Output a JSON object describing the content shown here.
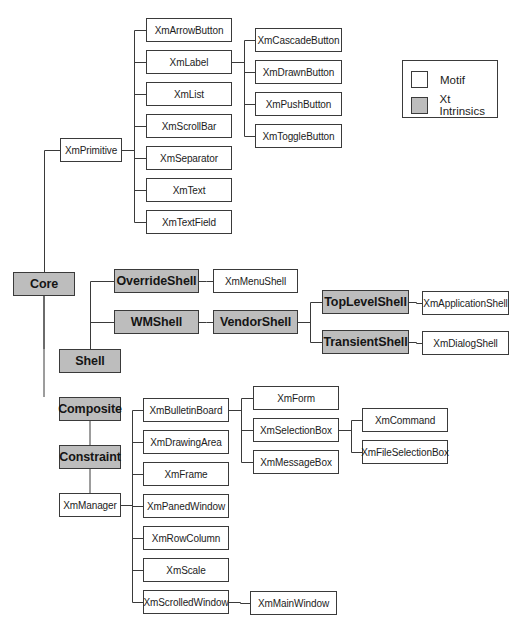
{
  "diagram": {
    "type": "class-hierarchy-tree",
    "colors": {
      "motif": "#ffffff",
      "xt": "#bdbdbd",
      "line": "#3a3a3a"
    },
    "legend": {
      "box": [
        402,
        60,
        96,
        58
      ],
      "items": [
        {
          "label": "Motif",
          "kind": "motif"
        },
        {
          "label": "Xt Intrinsics",
          "kind": "xt"
        }
      ]
    },
    "nodes": [
      {
        "id": "core",
        "label": "Core",
        "kind": "xt",
        "box": [
          13,
          272,
          62,
          24
        ]
      },
      {
        "id": "xmprimitive",
        "label": "XmPrimitive",
        "kind": "motif",
        "box": [
          60,
          138,
          62,
          24
        ]
      },
      {
        "id": "xmarrowbutton",
        "label": "XmArrowButton",
        "kind": "motif",
        "box": [
          146,
          18,
          86,
          24
        ]
      },
      {
        "id": "xmlabel",
        "label": "XmLabel",
        "kind": "motif",
        "box": [
          146,
          50,
          86,
          24
        ]
      },
      {
        "id": "xmlist",
        "label": "XmList",
        "kind": "motif",
        "box": [
          146,
          82,
          86,
          24
        ]
      },
      {
        "id": "xmscrollbar",
        "label": "XmScrollBar",
        "kind": "motif",
        "box": [
          146,
          114,
          86,
          24
        ]
      },
      {
        "id": "xmseparator",
        "label": "XmSeparator",
        "kind": "motif",
        "box": [
          146,
          146,
          86,
          24
        ]
      },
      {
        "id": "xmtext",
        "label": "XmText",
        "kind": "motif",
        "box": [
          146,
          178,
          86,
          24
        ]
      },
      {
        "id": "xmtextfield",
        "label": "XmTextField",
        "kind": "motif",
        "box": [
          146,
          210,
          86,
          24
        ]
      },
      {
        "id": "xmcascadebutton",
        "label": "XmCascadeButton",
        "kind": "motif",
        "box": [
          255,
          28,
          87,
          24
        ]
      },
      {
        "id": "xmdrawnbutton",
        "label": "XmDrawnButton",
        "kind": "motif",
        "box": [
          255,
          60,
          87,
          24
        ]
      },
      {
        "id": "xmpushbutton",
        "label": "XmPushButton",
        "kind": "motif",
        "box": [
          255,
          92,
          87,
          24
        ]
      },
      {
        "id": "xmtogglebutton",
        "label": "XmToggleButton",
        "kind": "motif",
        "box": [
          255,
          124,
          87,
          24
        ]
      },
      {
        "id": "overrideshell",
        "label": "OverrideShell",
        "kind": "xt",
        "box": [
          114,
          269,
          85,
          24
        ]
      },
      {
        "id": "xmmenushell",
        "label": "XmMenuShell",
        "kind": "motif",
        "box": [
          213,
          269,
          85,
          24
        ]
      },
      {
        "id": "wmshell",
        "label": "WMShell",
        "kind": "xt",
        "box": [
          114,
          310,
          85,
          24
        ]
      },
      {
        "id": "vendorshell",
        "label": "VendorShell",
        "kind": "xt",
        "box": [
          213,
          310,
          85,
          24
        ]
      },
      {
        "id": "toplevelshell",
        "label": "TopLevelShell",
        "kind": "xt",
        "box": [
          322,
          290,
          87,
          24
        ]
      },
      {
        "id": "xmapplicationshell",
        "label": "XmApplicationShell",
        "kind": "motif",
        "box": [
          422,
          291,
          87,
          24
        ]
      },
      {
        "id": "transientshell",
        "label": "TransientShell",
        "kind": "xt",
        "box": [
          322,
          330,
          87,
          24
        ]
      },
      {
        "id": "xmdialogshell",
        "label": "XmDialogShell",
        "kind": "motif",
        "box": [
          422,
          331,
          87,
          24
        ]
      },
      {
        "id": "shell",
        "label": "Shell",
        "kind": "xt",
        "box": [
          59,
          349,
          62,
          24
        ]
      },
      {
        "id": "composite",
        "label": "Composite",
        "kind": "xt",
        "box": [
          59,
          397,
          62,
          24
        ]
      },
      {
        "id": "constraint",
        "label": "Constraint",
        "kind": "xt",
        "box": [
          59,
          445,
          62,
          24
        ]
      },
      {
        "id": "xmmanager",
        "label": "XmManager",
        "kind": "motif",
        "box": [
          59,
          493,
          62,
          24
        ]
      },
      {
        "id": "xmbulletinboard",
        "label": "XmBulletinBoard",
        "kind": "motif",
        "box": [
          143,
          398,
          86,
          24
        ]
      },
      {
        "id": "xmdrawingarea",
        "label": "XmDrawingArea",
        "kind": "motif",
        "box": [
          143,
          430,
          86,
          24
        ]
      },
      {
        "id": "xmframe",
        "label": "XmFrame",
        "kind": "motif",
        "box": [
          143,
          462,
          86,
          24
        ]
      },
      {
        "id": "xmpanedwindow",
        "label": "XmPanedWindow",
        "kind": "motif",
        "box": [
          143,
          494,
          86,
          24
        ]
      },
      {
        "id": "xmrowcolumn",
        "label": "XmRowColumn",
        "kind": "motif",
        "box": [
          143,
          526,
          86,
          24
        ]
      },
      {
        "id": "xmscale",
        "label": "XmScale",
        "kind": "motif",
        "box": [
          143,
          558,
          86,
          24
        ]
      },
      {
        "id": "xmscrolledwindow",
        "label": "XmScrolledWindow",
        "kind": "motif",
        "box": [
          143,
          590,
          86,
          24
        ]
      },
      {
        "id": "xmform",
        "label": "XmForm",
        "kind": "motif",
        "box": [
          253,
          386,
          86,
          24
        ]
      },
      {
        "id": "xmselectionbox",
        "label": "XmSelectionBox",
        "kind": "motif",
        "box": [
          253,
          418,
          86,
          24
        ]
      },
      {
        "id": "xmmessagebox",
        "label": "XmMessageBox",
        "kind": "motif",
        "box": [
          253,
          450,
          86,
          24
        ]
      },
      {
        "id": "xmcommand",
        "label": "XmCommand",
        "kind": "motif",
        "box": [
          362,
          408,
          86,
          24
        ]
      },
      {
        "id": "xmfileselectionbox",
        "label": "XmFileSelectionBox",
        "kind": "motif",
        "box": [
          362,
          440,
          86,
          24
        ]
      },
      {
        "id": "xmmainwindow",
        "label": "XmMainWindow",
        "kind": "motif",
        "box": [
          250,
          591,
          87,
          24
        ]
      }
    ],
    "edges": [
      [
        "core",
        "xmprimitive"
      ],
      [
        "core",
        "shell"
      ],
      [
        "core",
        "composite"
      ],
      [
        "xmprimitive",
        "xmarrowbutton"
      ],
      [
        "xmprimitive",
        "xmlabel"
      ],
      [
        "xmprimitive",
        "xmlist"
      ],
      [
        "xmprimitive",
        "xmscrollbar"
      ],
      [
        "xmprimitive",
        "xmseparator"
      ],
      [
        "xmprimitive",
        "xmtext"
      ],
      [
        "xmprimitive",
        "xmtextfield"
      ],
      [
        "xmlabel",
        "xmcascadebutton"
      ],
      [
        "xmlabel",
        "xmdrawnbutton"
      ],
      [
        "xmlabel",
        "xmpushbutton"
      ],
      [
        "xmlabel",
        "xmtogglebutton"
      ],
      [
        "shell",
        "overrideshell"
      ],
      [
        "shell",
        "wmshell"
      ],
      [
        "overrideshell",
        "xmmenushell"
      ],
      [
        "wmshell",
        "vendorshell"
      ],
      [
        "vendorshell",
        "toplevelshell"
      ],
      [
        "vendorshell",
        "transientshell"
      ],
      [
        "toplevelshell",
        "xmapplicationshell"
      ],
      [
        "transientshell",
        "xmdialogshell"
      ],
      [
        "composite",
        "constraint"
      ],
      [
        "constraint",
        "xmmanager"
      ],
      [
        "xmmanager",
        "xmbulletinboard"
      ],
      [
        "xmmanager",
        "xmdrawingarea"
      ],
      [
        "xmmanager",
        "xmframe"
      ],
      [
        "xmmanager",
        "xmpanedwindow"
      ],
      [
        "xmmanager",
        "xmrowcolumn"
      ],
      [
        "xmmanager",
        "xmscale"
      ],
      [
        "xmmanager",
        "xmscrolledwindow"
      ],
      [
        "xmbulletinboard",
        "xmform"
      ],
      [
        "xmbulletinboard",
        "xmselectionbox"
      ],
      [
        "xmbulletinboard",
        "xmmessagebox"
      ],
      [
        "xmselectionbox",
        "xmcommand"
      ],
      [
        "xmselectionbox",
        "xmfileselectionbox"
      ],
      [
        "xmscrolledwindow",
        "xmmainwindow"
      ]
    ]
  }
}
